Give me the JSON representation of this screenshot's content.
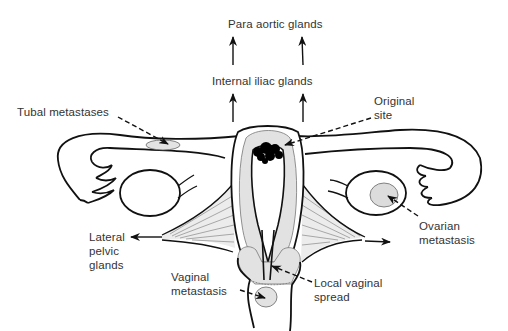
{
  "diagram": {
    "labels": {
      "para_aortic": "Para aortic glands",
      "internal_iliac": "Internal iliac glands",
      "tubal": "Tubal metastases",
      "original_site_1": "Original",
      "original_site_2": "site",
      "ovarian_1": "Ovarian",
      "ovarian_2": "metastasis",
      "lateral_1": "Lateral",
      "lateral_2": "pelvic",
      "lateral_3": "glands",
      "vaginal_met_1": "Vaginal",
      "vaginal_met_2": "metastasis",
      "local_spread_1": "Local vaginal",
      "local_spread_2": "spread"
    },
    "colors": {
      "outline": "#111111",
      "shading": "#d8d8d8",
      "tumor": "#000000",
      "text": "#333333"
    }
  }
}
